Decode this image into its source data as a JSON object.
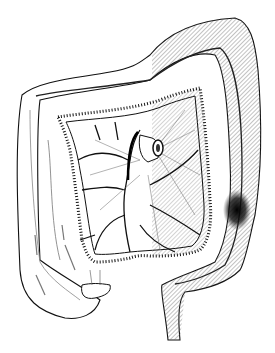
{
  "figure": {
    "style": "black ink line drawing",
    "colors": {
      "background": "#ffffff",
      "ink": "#111111",
      "hatch": "#555555",
      "lesion": "#000000"
    },
    "regions": [
      {
        "name": "ascending-colon",
        "shaded": false
      },
      {
        "name": "transverse-colon",
        "shaded": "partial-right"
      },
      {
        "name": "descending-colon",
        "shaded": true
      },
      {
        "name": "sigmoid-rectum",
        "shaded": false
      },
      {
        "name": "mesentery",
        "shaded": "partial-right"
      },
      {
        "name": "appendix",
        "shaded": false
      },
      {
        "name": "lesion-dark-spot",
        "shaded": true
      }
    ]
  }
}
